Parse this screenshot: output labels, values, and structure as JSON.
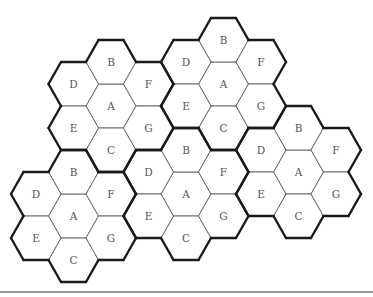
{
  "diagram": {
    "title": "",
    "hex_radius": 25,
    "hex_half_height": 22,
    "cell_layout": [
      {
        "label": "A",
        "col": 0,
        "row": 0
      },
      {
        "label": "D",
        "col": 0,
        "row": -2
      },
      {
        "label": "G",
        "col": 0,
        "row": 2
      },
      {
        "label": "C",
        "col": -1,
        "row": -1
      },
      {
        "label": "B",
        "col": -1,
        "row": 1
      },
      {
        "label": "E",
        "col": 1,
        "row": -1
      },
      {
        "label": "F",
        "col": 1,
        "row": 1
      }
    ],
    "clusters": [
      {
        "id": "cluster-1",
        "center": [
          111,
          106
        ],
        "cells": [
          "A",
          "B",
          "C",
          "D",
          "E",
          "F",
          "G"
        ]
      },
      {
        "id": "cluster-2",
        "center": [
          223.5,
          84
        ],
        "cells": [
          "A",
          "B",
          "C",
          "D",
          "E",
          "F",
          "G"
        ]
      },
      {
        "id": "cluster-3",
        "center": [
          73.5,
          216
        ],
        "cells": [
          "A",
          "B",
          "C",
          "D",
          "E",
          "F",
          "G"
        ]
      },
      {
        "id": "cluster-4",
        "center": [
          186,
          194
        ],
        "cells": [
          "A",
          "B",
          "C",
          "D",
          "E",
          "F",
          "G"
        ]
      },
      {
        "id": "cluster-5",
        "center": [
          298.5,
          172
        ],
        "cells": [
          "A",
          "B",
          "C",
          "D",
          "E",
          "F",
          "G"
        ]
      }
    ],
    "colors": {
      "cell_stroke": "#6a6a6a",
      "cluster_outline": "#1a1a1a",
      "label": "#555555",
      "rule": "#9a9a9a"
    }
  }
}
